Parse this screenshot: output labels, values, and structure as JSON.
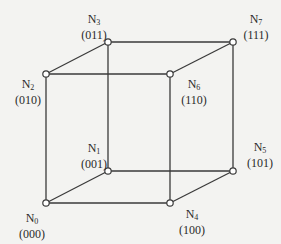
{
  "diagram": {
    "colors": {
      "line": "#3a3a3a",
      "node_fill": "#ffffff",
      "background": "#f3f3f1"
    },
    "nodes": [
      {
        "id": "N0",
        "base": "N",
        "index": "0",
        "code": "(000)",
        "x": 46,
        "y": 203,
        "label_x": 12,
        "label_y": 212
      },
      {
        "id": "N1",
        "base": "N",
        "index": "1",
        "code": "(001)",
        "x": 108,
        "y": 171,
        "label_x": 74,
        "label_y": 142
      },
      {
        "id": "N2",
        "base": "N",
        "index": "2",
        "code": "(010)",
        "x": 46,
        "y": 74,
        "label_x": 8,
        "label_y": 78
      },
      {
        "id": "N3",
        "base": "N",
        "index": "3",
        "code": "(011)",
        "x": 108,
        "y": 42,
        "label_x": 74,
        "label_y": 13
      },
      {
        "id": "N4",
        "base": "N",
        "index": "4",
        "code": "(100)",
        "x": 170,
        "y": 203,
        "label_x": 172,
        "label_y": 208
      },
      {
        "id": "N5",
        "base": "N",
        "index": "5",
        "code": "(101)",
        "x": 233,
        "y": 171,
        "label_x": 240,
        "label_y": 141
      },
      {
        "id": "N6",
        "base": "N",
        "index": "6",
        "code": "(110)",
        "x": 170,
        "y": 74,
        "label_x": 174,
        "label_y": 78
      },
      {
        "id": "N7",
        "base": "N",
        "index": "7",
        "code": "(111)",
        "x": 233,
        "y": 42,
        "label_x": 236,
        "label_y": 13
      }
    ],
    "edges": [
      [
        "N0",
        "N1"
      ],
      [
        "N0",
        "N2"
      ],
      [
        "N0",
        "N4"
      ],
      [
        "N1",
        "N3"
      ],
      [
        "N1",
        "N5"
      ],
      [
        "N2",
        "N3"
      ],
      [
        "N2",
        "N6"
      ],
      [
        "N3",
        "N7"
      ],
      [
        "N4",
        "N5"
      ],
      [
        "N4",
        "N6"
      ],
      [
        "N5",
        "N7"
      ],
      [
        "N6",
        "N7"
      ]
    ]
  }
}
